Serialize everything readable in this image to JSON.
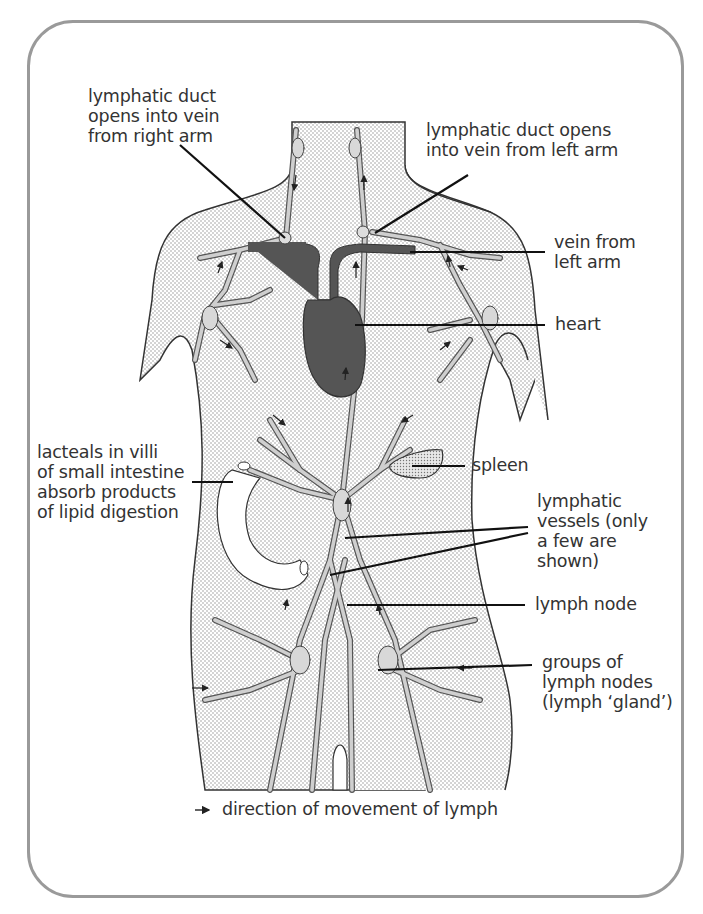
{
  "diagram": {
    "labels": {
      "duct_right": "lymphatic duct\nopens into vein\nfrom right arm",
      "duct_left": "lymphatic duct opens\ninto vein from left arm",
      "vein_left": "vein from\nleft arm",
      "heart": "heart",
      "lacteals": "lacteals in villi\nof small intestine\nabsorb products\nof lipid digestion",
      "spleen": "spleen",
      "vessels": "lymphatic\nvessels (only\na few are\nshown)",
      "lymph_node": "lymph node",
      "gland": "groups of\nlymph nodes\n(lymph ‘gland’)"
    },
    "legend": {
      "arrow_icon": "right-arrow",
      "text": "direction of movement of lymph"
    },
    "colors": {
      "frame": "#9a9a9a",
      "body_fill": "#e4e4e4",
      "vessel_fill": "#c8c8c8",
      "heart_vein": "#555555",
      "line": "#111111"
    }
  }
}
